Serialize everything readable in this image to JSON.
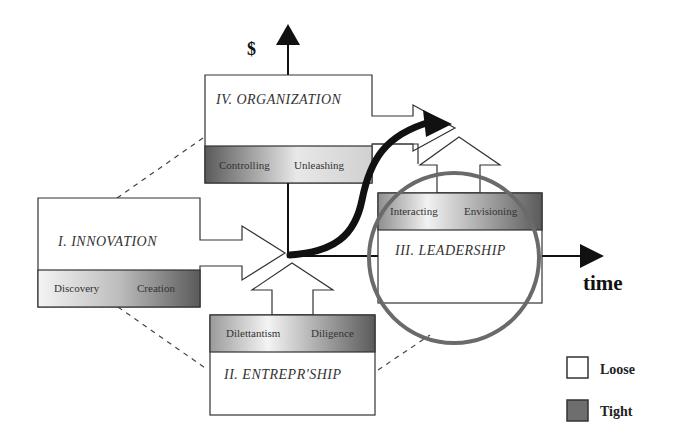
{
  "axes": {
    "y_label": "$",
    "x_label": "time"
  },
  "quadrants": {
    "organization": {
      "title": "IV. ORGANIZATION",
      "band_left": "Controlling",
      "band_right": "Unleashing"
    },
    "innovation": {
      "title": "I. INNOVATION",
      "band_left": "Discovery",
      "band_right": "Creation"
    },
    "entrepreneurship": {
      "title": "II. ENTREPR'SHIP",
      "band_left": "Dilettantism",
      "band_right": "Diligence"
    },
    "leadership": {
      "title": "III. LEADERSHIP",
      "band_left": "Interacting",
      "band_right": "Envisioning"
    }
  },
  "legend": {
    "items": [
      {
        "label": "Loose",
        "color": "#ffffff"
      },
      {
        "label": "Tight",
        "color": "#6e6e6e"
      }
    ]
  },
  "colors": {
    "stroke": "#333333",
    "circle": "#6a6a6a",
    "band_dark": "#5a5a5a",
    "band_light": "#f2f2f2"
  }
}
